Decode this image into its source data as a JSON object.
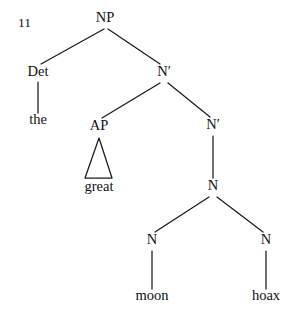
{
  "figure": {
    "example_number": "11",
    "width": 299,
    "height": 322,
    "background_color": "#ffffff",
    "ink_color": "#1a1a1a",
    "type": "syntax-tree"
  },
  "nodes": {
    "np": {
      "label": "NP",
      "x": 105,
      "y": 22
    },
    "det": {
      "label": "Det",
      "x": 38,
      "y": 76
    },
    "the": {
      "label": "the",
      "x": 38,
      "y": 124
    },
    "nbar1": {
      "label": "N′",
      "x": 164,
      "y": 76
    },
    "ap": {
      "label": "AP",
      "x": 99,
      "y": 130
    },
    "great": {
      "label": "great",
      "x": 99,
      "y": 191
    },
    "nbar2": {
      "label": "N′",
      "x": 213,
      "y": 129
    },
    "n_compound": {
      "label": "N",
      "x": 213,
      "y": 190
    },
    "n_left": {
      "label": "N",
      "x": 152,
      "y": 244
    },
    "n_right": {
      "label": "N",
      "x": 266,
      "y": 244
    },
    "moon": {
      "label": "moon",
      "x": 152,
      "y": 300
    },
    "hoax": {
      "label": "hoax",
      "x": 266,
      "y": 300
    }
  },
  "edges": [
    {
      "name": "np-to-det",
      "x1": 104,
      "y1": 29,
      "x2": 41,
      "y2": 64
    },
    {
      "name": "np-to-nbar1",
      "x1": 108,
      "y1": 29,
      "x2": 160,
      "y2": 64
    },
    {
      "name": "det-to-the",
      "x1": 38,
      "y1": 82,
      "x2": 38,
      "y2": 113
    },
    {
      "name": "nbar1-to-ap",
      "x1": 160,
      "y1": 83,
      "x2": 102,
      "y2": 118
    },
    {
      "name": "nbar1-to-nbar2",
      "x1": 168,
      "y1": 83,
      "x2": 210,
      "y2": 117
    },
    {
      "name": "nbar2-to-n",
      "x1": 213,
      "y1": 136,
      "x2": 213,
      "y2": 178
    },
    {
      "name": "n-to-n-left",
      "x1": 209,
      "y1": 197,
      "x2": 155,
      "y2": 232
    },
    {
      "name": "n-to-n-right",
      "x1": 217,
      "y1": 197,
      "x2": 263,
      "y2": 232
    },
    {
      "name": "n-left-to-moon",
      "x1": 152,
      "y1": 251,
      "x2": 152,
      "y2": 289
    },
    {
      "name": "n-right-to-hoax",
      "x1": 266,
      "y1": 251,
      "x2": 266,
      "y2": 289
    }
  ],
  "triangle": {
    "name": "ap-triangle",
    "apex_x": 99,
    "apex_y": 138,
    "left_x": 85,
    "left_y": 178,
    "right_x": 112,
    "right_y": 178
  },
  "tree_structure": {
    "root": "NP",
    "bracketing": "[NP [Det the] [N′ [AP great] [N′ [N [N moon] [N hoax]]]]]",
    "terminals": [
      "the",
      "great",
      "moon",
      "hoax"
    ],
    "phrase": "the great moon hoax"
  }
}
